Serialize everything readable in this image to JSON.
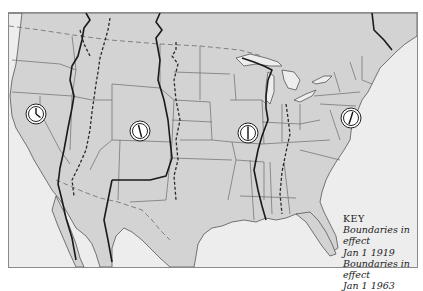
{
  "map": {
    "subject": "Time zone boundaries of the United States",
    "colors": {
      "land": "#d3d3d3",
      "water": "#ededed",
      "frame_border": "#8a8a8a",
      "boundary_1919": "#1a1a1a",
      "boundary_1963": "#2a2a2a"
    },
    "clocks": [
      {
        "zone": "pacific",
        "x": 36,
        "y": 114,
        "icon": "clock-icon"
      },
      {
        "zone": "mountain",
        "x": 140,
        "y": 131,
        "icon": "clock-icon"
      },
      {
        "zone": "central",
        "x": 248,
        "y": 133,
        "icon": "clock-icon"
      },
      {
        "zone": "eastern",
        "x": 351,
        "y": 118,
        "icon": "clock-icon"
      }
    ]
  },
  "key": {
    "title": "KEY",
    "entries": [
      {
        "label_line1": "Boundaries in effect",
        "label_line2": "Jan 1 1919",
        "line_style": "solid"
      },
      {
        "label_line1": "Boundaries in effect",
        "label_line2": "Jan 1 1963",
        "line_style": "dashed"
      }
    ]
  }
}
